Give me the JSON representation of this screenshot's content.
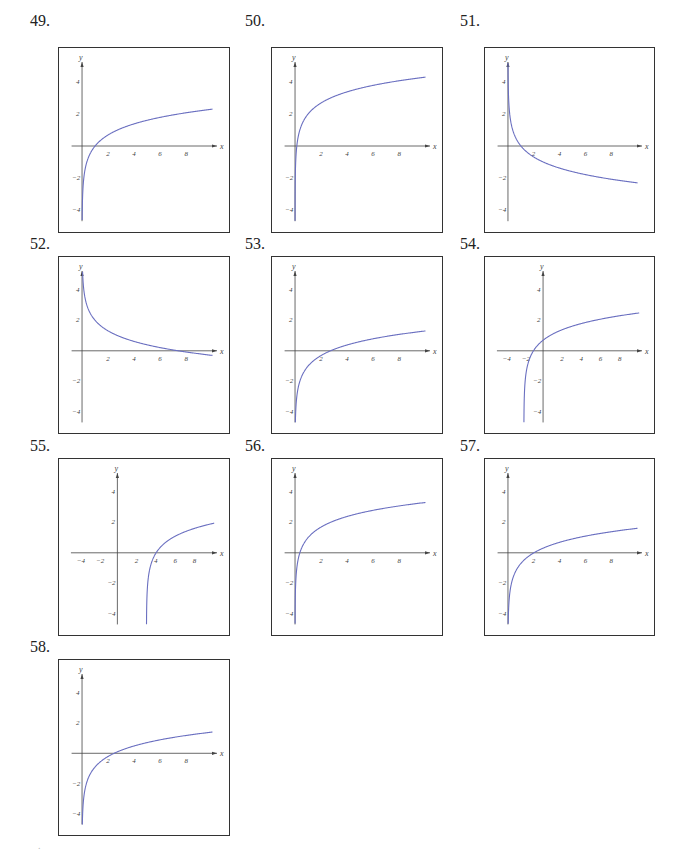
{
  "style": {
    "curve_color": "#6a6fc0",
    "axis_color": "#444444",
    "box_color": "#333333"
  },
  "panels": [
    {
      "number": "49.",
      "pos": {
        "numX": 30,
        "numY": 12,
        "boxX": 58,
        "boxY": 47,
        "w": 172,
        "h": 186
      },
      "xlim": [
        -1,
        10.5
      ],
      "xticks": [
        2,
        4,
        6,
        8
      ],
      "yticks": [
        4,
        2,
        -2,
        -4
      ],
      "ylim": [
        -5,
        5.5
      ]
    },
    {
      "number": "50.",
      "pos": {
        "numX": 245,
        "numY": 12,
        "boxX": 271,
        "boxY": 47,
        "w": 172,
        "h": 186
      },
      "xlim": [
        -1,
        10.5
      ],
      "xticks": [
        2,
        4,
        6,
        8
      ],
      "yticks": [
        4,
        2,
        -2,
        -4
      ],
      "ylim": [
        -5,
        5.5
      ]
    },
    {
      "number": "51.",
      "pos": {
        "numX": 460,
        "numY": 12,
        "boxX": 484,
        "boxY": 47,
        "w": 171,
        "h": 186
      },
      "xlim": [
        -1,
        10.5
      ],
      "xticks": [
        2,
        4,
        6,
        8
      ],
      "yticks": [
        4,
        2,
        -2,
        -4
      ],
      "ylim": [
        -5,
        5.5
      ]
    },
    {
      "number": "52.",
      "pos": {
        "numX": 30,
        "numY": 235,
        "boxX": 58,
        "boxY": 256,
        "w": 172,
        "h": 178
      },
      "xlim": [
        -1,
        10.5
      ],
      "xticks": [
        2,
        4,
        6,
        8
      ],
      "yticks": [
        4,
        2,
        -2,
        -4
      ],
      "ylim": [
        -5,
        5.5
      ]
    },
    {
      "number": "53.",
      "pos": {
        "numX": 245,
        "numY": 235,
        "boxX": 271,
        "boxY": 256,
        "w": 172,
        "h": 178
      },
      "xlim": [
        -1,
        10.5
      ],
      "xticks": [
        2,
        4,
        6,
        8
      ],
      "yticks": [
        4,
        2,
        -2,
        -4
      ],
      "ylim": [
        -5,
        5.5
      ]
    },
    {
      "number": "54.",
      "pos": {
        "numX": 460,
        "numY": 235,
        "boxX": 484,
        "boxY": 256,
        "w": 171,
        "h": 178
      },
      "xlim": [
        -5,
        10.5
      ],
      "xticks": [
        -4,
        -2,
        2,
        4,
        6,
        8
      ],
      "yticks": [
        4,
        2,
        -2,
        -4
      ],
      "ylim": [
        -5,
        5.5
      ]
    },
    {
      "number": "55.",
      "pos": {
        "numX": 30,
        "numY": 437,
        "boxX": 58,
        "boxY": 458,
        "w": 172,
        "h": 178
      },
      "xlim": [
        -5,
        10.5
      ],
      "xticks": [
        -4,
        -2,
        2,
        4,
        6,
        8
      ],
      "yticks": [
        4,
        2,
        -2,
        -4
      ],
      "ylim": [
        -5,
        5.5
      ]
    },
    {
      "number": "56.",
      "pos": {
        "numX": 245,
        "numY": 437,
        "boxX": 271,
        "boxY": 458,
        "w": 172,
        "h": 178
      },
      "xlim": [
        -1,
        10.5
      ],
      "xticks": [
        2,
        4,
        6,
        8
      ],
      "yticks": [
        4,
        2,
        -2,
        -4
      ],
      "ylim": [
        -5,
        5.5
      ]
    },
    {
      "number": "57.",
      "pos": {
        "numX": 460,
        "numY": 437,
        "boxX": 484,
        "boxY": 458,
        "w": 171,
        "h": 178
      },
      "xlim": [
        -1,
        10.5
      ],
      "xticks": [
        2,
        4,
        6,
        8
      ],
      "yticks": [
        4,
        2,
        -2,
        -4
      ],
      "ylim": [
        -5,
        5.5
      ]
    },
    {
      "number": "58.",
      "pos": {
        "numX": 30,
        "numY": 638,
        "boxX": 58,
        "boxY": 659,
        "w": 172,
        "h": 177
      },
      "xlim": [
        -1,
        10.5
      ],
      "xticks": [
        2,
        4,
        6,
        8
      ],
      "yticks": [
        4,
        2,
        -2,
        -4
      ],
      "ylim": [
        -5,
        5.5
      ]
    }
  ],
  "chart_data": [
    {
      "type": "line",
      "title": "49.",
      "xlabel": "x",
      "ylabel": "y",
      "xlim": [
        0,
        10
      ],
      "ylim": [
        -4,
        4
      ],
      "x_ticks": [
        2,
        4,
        6,
        8
      ],
      "y_ticks": [
        -4,
        -2,
        2,
        4
      ],
      "series": [
        {
          "name": "curve",
          "x": [
            0.02,
            0.1,
            0.5,
            1,
            2,
            4,
            6,
            8,
            10
          ],
          "y": [
            -3.9,
            -2.3,
            -0.69,
            0,
            0.69,
            1.39,
            1.79,
            2.08,
            2.3
          ]
        }
      ]
    },
    {
      "type": "line",
      "title": "50.",
      "xlabel": "x",
      "ylabel": "y",
      "xlim": [
        0,
        10
      ],
      "ylim": [
        -4,
        4
      ],
      "x_ticks": [
        2,
        4,
        6,
        8
      ],
      "y_ticks": [
        -4,
        -2,
        2,
        4
      ],
      "series": [
        {
          "name": "curve",
          "x": [
            0.004,
            0.02,
            0.135,
            0.5,
            1,
            2,
            4,
            6,
            8,
            10
          ],
          "y": [
            -3.5,
            -1.9,
            0,
            1.31,
            2,
            2.69,
            3.39,
            3.79,
            4.08,
            4.3
          ]
        }
      ]
    },
    {
      "type": "line",
      "title": "51.",
      "xlabel": "x",
      "ylabel": "y",
      "xlim": [
        0,
        10
      ],
      "ylim": [
        -4,
        4
      ],
      "x_ticks": [
        2,
        4,
        6,
        8
      ],
      "y_ticks": [
        -4,
        -2,
        2,
        4
      ],
      "series": [
        {
          "name": "curve",
          "x": [
            0.02,
            0.1,
            0.5,
            1,
            2,
            4,
            6,
            8,
            10
          ],
          "y": [
            3.9,
            2.3,
            0.69,
            0,
            -0.69,
            -1.39,
            -1.79,
            -2.08,
            -2.3
          ]
        }
      ]
    },
    {
      "type": "line",
      "title": "52.",
      "xlabel": "x",
      "ylabel": "y",
      "xlim": [
        0,
        10
      ],
      "ylim": [
        -4,
        4
      ],
      "x_ticks": [
        2,
        4,
        6,
        8
      ],
      "y_ticks": [
        -4,
        -2,
        2,
        4
      ],
      "series": [
        {
          "name": "curve",
          "x": [
            0.05,
            0.2,
            0.5,
            1,
            2,
            4,
            6,
            7.39,
            8,
            10
          ],
          "y": [
            5.0,
            3.61,
            2.69,
            2,
            1.31,
            0.61,
            0.21,
            0,
            -0.08,
            -0.3
          ]
        }
      ]
    },
    {
      "type": "line",
      "title": "53.",
      "xlabel": "x",
      "ylabel": "y",
      "xlim": [
        0,
        10
      ],
      "ylim": [
        -4,
        4
      ],
      "x_ticks": [
        2,
        4,
        6,
        8
      ],
      "y_ticks": [
        -4,
        -2,
        2,
        4
      ],
      "series": [
        {
          "name": "curve",
          "x": [
            0.01,
            0.05,
            0.2,
            0.5,
            1,
            2,
            2.72,
            4,
            6,
            8,
            10
          ],
          "y": [
            -5.6,
            -4.0,
            -2.61,
            -1.69,
            -1,
            -0.31,
            0,
            0.39,
            0.79,
            1.08,
            1.3
          ]
        }
      ]
    },
    {
      "type": "line",
      "title": "54.",
      "xlabel": "x",
      "ylabel": "y",
      "xlim": [
        -4,
        10
      ],
      "ylim": [
        -4,
        4
      ],
      "x_ticks": [
        -4,
        -2,
        2,
        4,
        6,
        8
      ],
      "y_ticks": [
        -4,
        -2,
        2,
        4
      ],
      "series": [
        {
          "name": "curve",
          "x": [
            -1.99,
            -1.9,
            -1.5,
            -1,
            0,
            2,
            4,
            6,
            8,
            10
          ],
          "y": [
            -4.6,
            -2.3,
            -0.69,
            0,
            0.69,
            1.39,
            1.79,
            2.08,
            2.3,
            2.48
          ]
        }
      ]
    },
    {
      "type": "line",
      "title": "55.",
      "xlabel": "x",
      "ylabel": "y",
      "xlim": [
        -4,
        10
      ],
      "ylim": [
        -4,
        4
      ],
      "x_ticks": [
        -4,
        -2,
        2,
        4,
        6,
        8
      ],
      "y_ticks": [
        -4,
        -2,
        2,
        4
      ],
      "series": [
        {
          "name": "curve",
          "x": [
            3.01,
            3.1,
            3.5,
            4,
            5,
            6,
            8,
            10
          ],
          "y": [
            -4.6,
            -2.3,
            -0.69,
            0,
            0.69,
            1.1,
            1.61,
            1.95
          ]
        }
      ]
    },
    {
      "type": "line",
      "title": "56.",
      "xlabel": "x",
      "ylabel": "y",
      "xlim": [
        0,
        10
      ],
      "ylim": [
        -4,
        4
      ],
      "x_ticks": [
        2,
        4,
        6,
        8
      ],
      "y_ticks": [
        -4,
        -2,
        2,
        4
      ],
      "series": [
        {
          "name": "curve",
          "x": [
            0.007,
            0.05,
            0.37,
            1,
            2,
            4,
            6,
            8,
            10
          ],
          "y": [
            -4.0,
            -2.0,
            0,
            1,
            1.69,
            2.39,
            2.79,
            3.08,
            3.3
          ]
        }
      ]
    },
    {
      "type": "line",
      "title": "57.",
      "xlabel": "x",
      "ylabel": "y",
      "xlim": [
        0,
        10
      ],
      "ylim": [
        -4,
        4
      ],
      "x_ticks": [
        2,
        4,
        6,
        8
      ],
      "y_ticks": [
        -4,
        -2,
        2,
        4
      ],
      "series": [
        {
          "name": "curve",
          "x": [
            0.02,
            0.1,
            0.5,
            1,
            2,
            4,
            6,
            8,
            10
          ],
          "y": [
            -4.6,
            -3.0,
            -1.39,
            -0.69,
            0,
            0.69,
            1.1,
            1.39,
            1.61
          ]
        }
      ]
    },
    {
      "type": "line",
      "title": "58.",
      "xlabel": "x",
      "ylabel": "y",
      "xlim": [
        0,
        10
      ],
      "ylim": [
        -4,
        4
      ],
      "x_ticks": [
        2,
        4,
        6,
        8
      ],
      "y_ticks": [
        -4,
        -2,
        2,
        4
      ],
      "series": [
        {
          "name": "curve",
          "x": [
            0.01,
            0.05,
            0.2,
            0.5,
            1,
            2,
            2.72,
            4,
            6,
            8,
            10
          ],
          "y": [
            -5.6,
            -4.0,
            -2.61,
            -1.69,
            -1,
            -0.31,
            0,
            0.39,
            0.79,
            1.08,
            1.3
          ]
        }
      ]
    }
  ],
  "functions": [
    {
      "a": 1,
      "h": 0,
      "k": 0
    },
    {
      "a": 1,
      "h": 0,
      "k": 2
    },
    {
      "a": -1,
      "h": 0,
      "k": 0
    },
    {
      "a": -1,
      "h": 0,
      "k": 2
    },
    {
      "a": 1,
      "h": 0,
      "k": -1
    },
    {
      "a": 1,
      "h": -2,
      "k": 0
    },
    {
      "a": 1,
      "h": 3,
      "k": 0
    },
    {
      "a": 1,
      "h": 0,
      "k": 1
    },
    {
      "a": 1,
      "h": 0,
      "k": -0.693
    },
    {
      "a": 1,
      "h": 0,
      "k": -0.9
    }
  ],
  "labels": {
    "x_axis": "x",
    "y_axis": "y"
  },
  "footer_mark": "."
}
